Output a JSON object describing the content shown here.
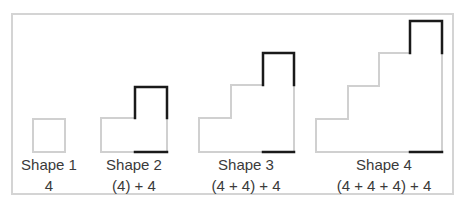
{
  "figure": {
    "shapes": [
      {
        "name": "Shape 1",
        "expression": "4"
      },
      {
        "name": "Shape 2",
        "expression": "(4) + 4"
      },
      {
        "name": "Shape 3",
        "expression": "(4 + 4) + 4"
      },
      {
        "name": "Shape 4",
        "expression": "(4 + 4 + 4) + 4"
      }
    ],
    "colors": {
      "frame": "#d4d4d4",
      "light_line": "#d0d0d0",
      "dark_line": "#1a1a1a",
      "text": "#3a3a3a"
    }
  }
}
